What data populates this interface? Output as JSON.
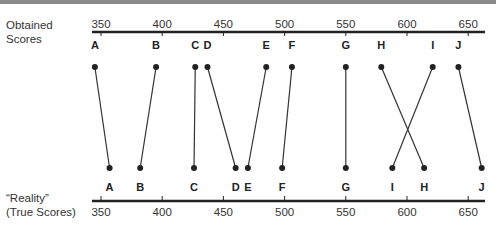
{
  "labels": {
    "top_axis": [
      "Obtained",
      "Scores"
    ],
    "bottom_axis": [
      "“Reality”",
      "(True Scores)"
    ]
  },
  "axis": {
    "ticks": [
      350,
      400,
      450,
      500,
      550,
      600,
      650
    ],
    "min": 343,
    "max": 665
  },
  "chart_data": {
    "type": "paired-axis diagram",
    "title": "",
    "top_axis_label": "Obtained Scores",
    "bottom_axis_label": "“Reality” (True Scores)",
    "axis_range": [
      340,
      665
    ],
    "ticks": [
      350,
      400,
      450,
      500,
      550,
      600,
      650
    ],
    "points": [
      {
        "id": "A",
        "obtained": 345,
        "true": 357
      },
      {
        "id": "B",
        "obtained": 395,
        "true": 382
      },
      {
        "id": "C",
        "obtained": 427,
        "true": 426
      },
      {
        "id": "D",
        "obtained": 437,
        "true": 460
      },
      {
        "id": "E",
        "obtained": 485,
        "true": 470
      },
      {
        "id": "F",
        "obtained": 506,
        "true": 498
      },
      {
        "id": "G",
        "obtained": 550,
        "true": 550
      },
      {
        "id": "H",
        "obtained": 579,
        "true": 614
      },
      {
        "id": "I",
        "obtained": 621,
        "true": 588
      },
      {
        "id": "J",
        "obtained": 642,
        "true": 661
      }
    ]
  }
}
